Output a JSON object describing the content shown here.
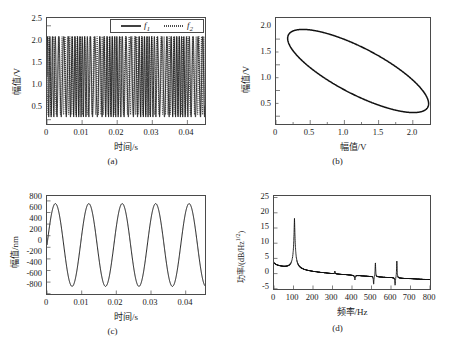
{
  "figure": {
    "panels": [
      {
        "caption": "(a)",
        "xlabel": "时间/s",
        "ylabel": "幅值/V",
        "xticks": [
          "0",
          "0.01",
          "0.02",
          "0.03",
          "0.04"
        ],
        "yticks": [
          "0.5",
          "1.0",
          "1.5",
          "2.0",
          "2.5"
        ],
        "legend": [
          {
            "label": "f",
            "subscript": "1",
            "style": "solid"
          },
          {
            "label": "f",
            "subscript": "2",
            "style": "dotted"
          }
        ]
      },
      {
        "caption": "(b)",
        "xlabel": "幅值/V",
        "ylabel": "幅值/V",
        "xticks": [
          "0",
          "0.5",
          "1.0",
          "1.5",
          "2.0"
        ],
        "yticks": [
          "0.5",
          "1.0",
          "1.5",
          "2.0"
        ]
      },
      {
        "caption": "(c)",
        "xlabel": "时间/s",
        "ylabel": "幅值/nm",
        "xticks": [
          "0",
          "0.01",
          "0.02",
          "0.03",
          "0.04"
        ],
        "yticks": [
          "-800",
          "-600",
          "-400",
          "-200",
          "0",
          "200",
          "400",
          "600",
          "800"
        ]
      },
      {
        "caption": "(d)",
        "xlabel": "频率/Hz",
        "ylabel_prefix": "功率/(dB/Hz",
        "ylabel_exp": "1/2",
        "ylabel_suffix": ")",
        "xticks": [
          "0",
          "100",
          "200",
          "300",
          "400",
          "500",
          "600",
          "700",
          "800"
        ],
        "yticks": [
          "-5",
          "0",
          "5",
          "10",
          "15",
          "20",
          "25"
        ]
      }
    ]
  },
  "chart_data": [
    {
      "type": "line",
      "panel": "(a)",
      "title": "",
      "xlabel": "时间/s",
      "ylabel": "幅值/V",
      "xlim": [
        0,
        0.045
      ],
      "ylim": [
        0.2,
        2.5
      ],
      "grid": false,
      "legend_position": "top-right",
      "series": [
        {
          "name": "f1",
          "style": "solid",
          "description": "Dense sinusoidal interference signal oscillating between about 0.35 V and 2.1 V",
          "carrier_frequency_hz": 1100,
          "envelope_frequency_hz": 105,
          "amplitude_min_v": 0.35,
          "amplitude_max_v": 2.1
        },
        {
          "name": "f2",
          "style": "dotted",
          "description": "Second interference channel, same band, phase shifted",
          "carrier_frequency_hz": 1100,
          "envelope_frequency_hz": 105,
          "amplitude_min_v": 0.4,
          "amplitude_max_v": 2.1
        }
      ]
    },
    {
      "type": "line",
      "panel": "(b)",
      "title": "",
      "xlabel": "幅值/V",
      "ylabel": "幅值/V",
      "xlim": [
        0,
        2.25
      ],
      "ylim": [
        0.15,
        2.25
      ],
      "grid": false,
      "description": "Lissajous ellipse of f1 versus f2, tilted with negative-going major axis",
      "ellipse": {
        "center_x": 1.2,
        "center_y": 1.2,
        "semi_major": 1.25,
        "semi_minor": 0.42,
        "rotation_deg": -37
      }
    },
    {
      "type": "line",
      "panel": "(c)",
      "title": "",
      "xlabel": "时间/s",
      "ylabel": "幅值/nm",
      "xlim": [
        0,
        0.045
      ],
      "ylim": [
        -900,
        900
      ],
      "grid": false,
      "description": "Demodulated displacement, near-sinusoidal",
      "frequency_hz": 105,
      "amplitude_nm": 760,
      "phase_rad": 0,
      "periods_visible": 4.7
    },
    {
      "type": "line",
      "panel": "(d)",
      "title": "",
      "xlabel": "频率/Hz",
      "ylabel": "功率/(dB/Hz1/2)",
      "xlim": [
        0,
        800
      ],
      "ylim": [
        -5,
        25
      ],
      "grid": false,
      "description": "Power spectral density with a dominant fundamental peak and weak harmonics",
      "peaks": [
        {
          "frequency_hz": 105,
          "value_db": 19.5,
          "label": "fundamental"
        },
        {
          "frequency_hz": 520,
          "value_db": 3.0,
          "label": "harmonic"
        },
        {
          "frequency_hz": 630,
          "value_db": 4.0,
          "label": "harmonic"
        }
      ],
      "baseline_start_db": 3.6,
      "baseline_end_db": -2.0
    }
  ]
}
